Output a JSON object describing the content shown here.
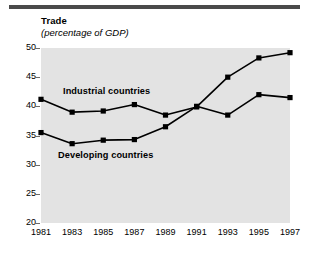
{
  "figure": {
    "title": "Trade",
    "subtitle": "(percentage of GDP)",
    "plot_background": "#e3e3e3",
    "rule_color": "#4a4a4a",
    "line_color": "#000000"
  },
  "chart_data": {
    "type": "line",
    "title": "Trade",
    "subtitle": "(percentage of GDP)",
    "xlabel": "",
    "ylabel": "",
    "x": [
      1981,
      1982,
      1983,
      1984,
      1985,
      1986,
      1987,
      1988,
      1989,
      1990,
      1991,
      1992,
      1993,
      1994,
      1995,
      1996,
      1997
    ],
    "categories": [
      "1981",
      "1983",
      "1985",
      "1987",
      "1989",
      "1991",
      "1993",
      "1995",
      "1997"
    ],
    "xtick_labels": [
      "1981",
      "1983",
      "1985",
      "1987",
      "1989",
      "1991",
      "1993",
      "1995",
      "1997"
    ],
    "xtick_values": [
      1981,
      1983,
      1985,
      1987,
      1989,
      1991,
      1993,
      1995,
      1997
    ],
    "ytick_labels": [
      "20",
      "25",
      "30",
      "35",
      "40",
      "45",
      "50"
    ],
    "ytick_values": [
      20,
      25,
      30,
      35,
      40,
      45,
      50
    ],
    "xlim": [
      1981,
      1997
    ],
    "ylim": [
      20,
      50
    ],
    "grid": false,
    "legend": "inline-annotations",
    "marker": "square",
    "series": [
      {
        "name": "Industrial countries",
        "label": "Industrial countries",
        "x": [
          1981,
          1983,
          1985,
          1987,
          1989,
          1991,
          1993,
          1995,
          1997
        ],
        "values": [
          41.2,
          39.0,
          39.2,
          40.3,
          38.5,
          39.9,
          45.0,
          48.3,
          49.2
        ]
      },
      {
        "name": "Developing countries",
        "label": "Developing countries",
        "x": [
          1981,
          1983,
          1985,
          1987,
          1989,
          1991,
          1993,
          1995,
          1997
        ],
        "values": [
          35.5,
          33.6,
          34.2,
          34.3,
          36.5,
          40.0,
          38.5,
          42.0,
          41.5
        ]
      }
    ]
  }
}
